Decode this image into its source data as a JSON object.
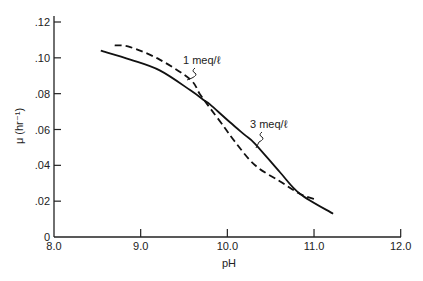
{
  "chart_data": {
    "type": "line",
    "title": "",
    "xlabel": "pH",
    "ylabel": "μ (hr⁻¹)",
    "xlim": [
      8.0,
      12.0
    ],
    "ylim": [
      0,
      0.12
    ],
    "grid": false,
    "legend_position": "inline annotations",
    "x_ticks": [
      8.0,
      9.0,
      10.0,
      11.0,
      12.0
    ],
    "x_tick_labels": [
      "8.0",
      "9.0",
      "10.0",
      "11.0",
      "12.0"
    ],
    "y_ticks": [
      0,
      0.02,
      0.04,
      0.06,
      0.08,
      0.1,
      0.12
    ],
    "y_tick_labels": [
      "0",
      ".02",
      ".04",
      ".06",
      ".08",
      ".10",
      ".12"
    ],
    "series": [
      {
        "name": "3 meq/ℓ",
        "style": "solid",
        "x": [
          8.54,
          8.88,
          9.22,
          9.57,
          9.74,
          9.8,
          10.03,
          10.2,
          10.32,
          10.61,
          10.84,
          11.22
        ],
        "values": [
          0.104,
          0.099,
          0.093,
          0.082,
          0.076,
          0.074,
          0.064,
          0.057,
          0.052,
          0.036,
          0.024,
          0.013
        ]
      },
      {
        "name": "1 meq/ℓ",
        "style": "dashed",
        "x": [
          8.7,
          8.88,
          9.22,
          9.57,
          9.68,
          9.8,
          9.97,
          10.09,
          10.32,
          10.61,
          10.84,
          11.02
        ],
        "values": [
          0.107,
          0.106,
          0.099,
          0.088,
          0.08,
          0.072,
          0.061,
          0.053,
          0.04,
          0.031,
          0.024,
          0.021
        ]
      }
    ],
    "annotations": [
      {
        "text": "1 meq/ℓ",
        "points_to": "1 meq/ℓ",
        "x": 9.65,
        "y": 0.098
      },
      {
        "text": "3 meq/ℓ",
        "points_to": "3 meq/ℓ",
        "x": 10.5,
        "y": 0.062
      }
    ]
  }
}
